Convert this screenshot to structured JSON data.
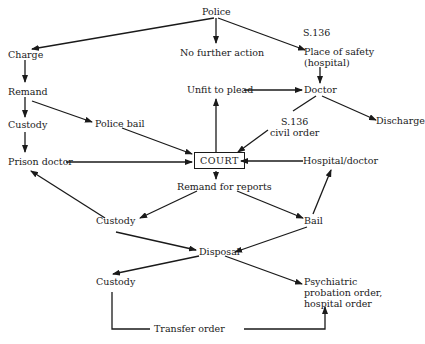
{
  "diagram": {
    "type": "flowchart",
    "nodes": {
      "police": "Police",
      "charge": "Charge",
      "no_further_action": "No further action",
      "s136_top": "S.136",
      "place_of_safety": "Place of safety",
      "place_of_safety_2": "(hospital)",
      "remand": "Remand",
      "unfit_to_plead": "Unfit to plead",
      "doctor": "Doctor",
      "custody_1": "Custody",
      "police_bail": "Police bail",
      "s136_civil": "S.136",
      "s136_civil_2": "civil order",
      "discharge": "Discharge",
      "prison_doctor": "Prison doctor",
      "court": "COURT",
      "hospital_doctor": "Hospital/doctor",
      "remand_for_reports": "Remand for reports",
      "custody_2": "Custody",
      "bail": "Bail",
      "disposal": "Disposal",
      "custody_3": "Custody",
      "psychiatric_1": "Psychiatric",
      "psychiatric_2": "probation order,",
      "psychiatric_3": "hospital order",
      "transfer_order": "Transfer order"
    },
    "edges": [
      {
        "from": "Police",
        "to": "Charge"
      },
      {
        "from": "Police",
        "to": "No further action"
      },
      {
        "from": "Police",
        "to": "Place of safety (hospital)",
        "label": "S.136"
      },
      {
        "from": "Charge",
        "to": "Remand"
      },
      {
        "from": "Remand",
        "to": "Custody"
      },
      {
        "from": "Remand",
        "to": "Police bail"
      },
      {
        "from": "Custody",
        "to": "Prison doctor"
      },
      {
        "from": "Police bail",
        "to": "COURT"
      },
      {
        "from": "Prison doctor",
        "to": "COURT"
      },
      {
        "from": "COURT",
        "to": "Unfit to plead"
      },
      {
        "from": "Unfit to plead",
        "to": "Doctor"
      },
      {
        "from": "Place of safety (hospital)",
        "to": "Doctor"
      },
      {
        "from": "Doctor",
        "to": "Discharge"
      },
      {
        "from": "Doctor",
        "to": "COURT",
        "label": "S.136 civil order"
      },
      {
        "from": "Hospital/doctor",
        "to": "COURT"
      },
      {
        "from": "COURT",
        "to": "Remand for reports"
      },
      {
        "from": "Remand for reports",
        "to": "Custody"
      },
      {
        "from": "Remand for reports",
        "to": "Bail"
      },
      {
        "from": "Custody",
        "to": "Prison doctor"
      },
      {
        "from": "Bail",
        "to": "Hospital/doctor"
      },
      {
        "from": "Custody",
        "to": "Disposal"
      },
      {
        "from": "Bail",
        "to": "Disposal"
      },
      {
        "from": "Disposal",
        "to": "Custody"
      },
      {
        "from": "Disposal",
        "to": "Psychiatric probation order, hospital order"
      },
      {
        "from": "Custody",
        "to": "Psychiatric probation order, hospital order",
        "label": "Transfer order"
      }
    ]
  }
}
